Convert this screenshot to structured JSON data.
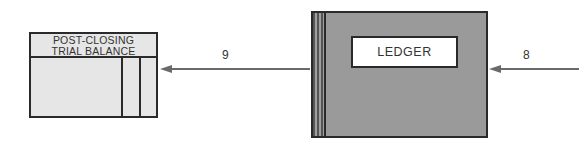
{
  "diagram": {
    "trial_balance": {
      "title_line1": "POST-CLOSING",
      "title_line2": "TRIAL BALANCE"
    },
    "ledger": {
      "label": "LEDGER"
    },
    "arrows": [
      {
        "step": "9",
        "from": "ledger",
        "to": "trial_balance"
      },
      {
        "step": "8",
        "from": "offscreen-right",
        "to": "ledger"
      }
    ],
    "colors": {
      "ledger_cover": "#9a9a9a",
      "trial_balance_fill": "#e6e6e6",
      "outline": "#2a2a2a",
      "arrow": "#6a6a6a"
    }
  }
}
